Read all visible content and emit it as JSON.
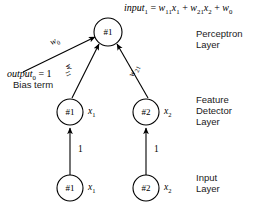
{
  "diagram": {
    "title_formula": {
      "lhs": "input",
      "lhs_sub": "1",
      "eq": " = ",
      "t1": "w",
      "t1_sub": "11",
      "t1_var": "x",
      "t1_var_sub": "1",
      "plus1": " + ",
      "t2": "w",
      "t2_sub": "21",
      "t2_var": "x",
      "t2_var_sub": "2",
      "plus2": " + ",
      "t3": "w",
      "t3_sub": "0",
      "full_text": "input1 = w11x1 + w21x2 + w0"
    },
    "bias": {
      "equation_lhs": "output",
      "equation_sub": "0",
      "equation_rhs": " = 1",
      "caption": "Bias term"
    },
    "layers": [
      {
        "id": "perceptron",
        "lines": [
          "Perceptron",
          "Layer"
        ]
      },
      {
        "id": "feature-detector",
        "lines": [
          "Feature",
          "Detector",
          "Layer"
        ]
      },
      {
        "id": "input",
        "lines": [
          "Input",
          "Layer"
        ]
      }
    ],
    "nodes": {
      "perceptron_1": {
        "label": "#1"
      },
      "feature_1": {
        "label": "#1",
        "var": "x",
        "var_sub": "1"
      },
      "feature_2": {
        "label": "#2",
        "var": "x",
        "var_sub": "2"
      },
      "input_1": {
        "label": "#1",
        "var": "x",
        "var_sub": "1"
      },
      "input_2": {
        "label": "#2",
        "var": "x",
        "var_sub": "2"
      }
    },
    "edge_weights": {
      "bias_to_perceptron": {
        "sym": "w",
        "sub": "0"
      },
      "feature1_to_perceptron": {
        "sym": "w",
        "sub": "11"
      },
      "feature2_to_perceptron": {
        "sym": "w",
        "sub": "21"
      },
      "input1_to_feature1": "1",
      "input2_to_feature2": "1"
    },
    "colors": {
      "stroke": "#000000",
      "fill": "#ffffff",
      "text": "#000000"
    }
  }
}
